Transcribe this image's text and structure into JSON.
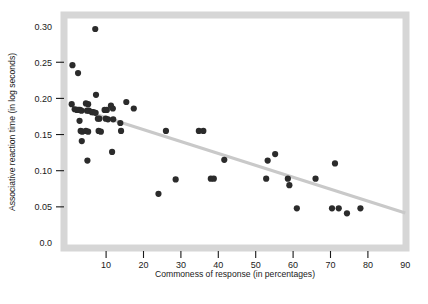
{
  "chart_data": {
    "type": "scatter",
    "title": "",
    "xlabel": "Commoness of response (in percentages)",
    "ylabel": "Associative reaction time (in log seconds)",
    "xlim": [
      0,
      90
    ],
    "ylim": [
      0.0,
      0.3
    ],
    "xticks": [
      10,
      20,
      30,
      40,
      50,
      60,
      70,
      80,
      90
    ],
    "xtick_labels": [
      "10",
      "20",
      "30",
      "40",
      "50",
      "60",
      "70",
      "80",
      "90"
    ],
    "yticks": [
      0.0,
      0.05,
      0.1,
      0.15,
      0.2,
      0.25,
      0.3
    ],
    "ytick_labels": [
      "0.0",
      "0.05",
      "0.10",
      "0.15",
      "0.20",
      "0.25",
      "0.30"
    ],
    "grid": false,
    "legend": false,
    "marker_color": "#2b2b2b",
    "marker_size": 3.1,
    "frame_color": "#d6d6d6",
    "trendline": {
      "name": "regression-line",
      "color": "#c9c9c9",
      "width": 3.2,
      "x_start": 1.0,
      "y_start": 0.188,
      "x_end": 90.0,
      "y_end": 0.0415
    },
    "points": [
      {
        "x": 1.0,
        "y": 0.246
      },
      {
        "x": 2.5,
        "y": 0.235
      },
      {
        "x": 0.8,
        "y": 0.192
      },
      {
        "x": 1.6,
        "y": 0.185
      },
      {
        "x": 2.2,
        "y": 0.184
      },
      {
        "x": 2.6,
        "y": 0.184
      },
      {
        "x": 3.0,
        "y": 0.184
      },
      {
        "x": 3.4,
        "y": 0.183
      },
      {
        "x": 2.9,
        "y": 0.169
      },
      {
        "x": 3.2,
        "y": 0.155
      },
      {
        "x": 3.6,
        "y": 0.154
      },
      {
        "x": 3.5,
        "y": 0.141
      },
      {
        "x": 4.6,
        "y": 0.193
      },
      {
        "x": 5.2,
        "y": 0.192
      },
      {
        "x": 4.9,
        "y": 0.183
      },
      {
        "x": 5.4,
        "y": 0.183
      },
      {
        "x": 4.6,
        "y": 0.155
      },
      {
        "x": 5.2,
        "y": 0.154
      },
      {
        "x": 5.0,
        "y": 0.114
      },
      {
        "x": 6.2,
        "y": 0.181
      },
      {
        "x": 6.6,
        "y": 0.181
      },
      {
        "x": 7.1,
        "y": 0.296
      },
      {
        "x": 7.3,
        "y": 0.205
      },
      {
        "x": 7.2,
        "y": 0.18
      },
      {
        "x": 7.8,
        "y": 0.172
      },
      {
        "x": 8.2,
        "y": 0.172
      },
      {
        "x": 8.0,
        "y": 0.155
      },
      {
        "x": 8.6,
        "y": 0.154
      },
      {
        "x": 9.6,
        "y": 0.184
      },
      {
        "x": 10.2,
        "y": 0.184
      },
      {
        "x": 9.9,
        "y": 0.172
      },
      {
        "x": 10.5,
        "y": 0.171
      },
      {
        "x": 11.3,
        "y": 0.19
      },
      {
        "x": 11.8,
        "y": 0.186
      },
      {
        "x": 11.9,
        "y": 0.171
      },
      {
        "x": 11.6,
        "y": 0.126
      },
      {
        "x": 13.8,
        "y": 0.166
      },
      {
        "x": 14.0,
        "y": 0.155
      },
      {
        "x": 15.4,
        "y": 0.195
      },
      {
        "x": 17.4,
        "y": 0.186
      },
      {
        "x": 24.0,
        "y": 0.068
      },
      {
        "x": 26.0,
        "y": 0.155
      },
      {
        "x": 28.6,
        "y": 0.088
      },
      {
        "x": 34.8,
        "y": 0.155
      },
      {
        "x": 36.0,
        "y": 0.155
      },
      {
        "x": 38.0,
        "y": 0.089
      },
      {
        "x": 38.8,
        "y": 0.089
      },
      {
        "x": 41.6,
        "y": 0.115
      },
      {
        "x": 53.2,
        "y": 0.114
      },
      {
        "x": 55.2,
        "y": 0.123
      },
      {
        "x": 52.8,
        "y": 0.089
      },
      {
        "x": 58.6,
        "y": 0.089
      },
      {
        "x": 59.0,
        "y": 0.08
      },
      {
        "x": 61.0,
        "y": 0.048
      },
      {
        "x": 66.0,
        "y": 0.089
      },
      {
        "x": 71.2,
        "y": 0.11
      },
      {
        "x": 70.4,
        "y": 0.048
      },
      {
        "x": 72.2,
        "y": 0.048
      },
      {
        "x": 74.4,
        "y": 0.041
      },
      {
        "x": 78.0,
        "y": 0.048
      }
    ]
  }
}
